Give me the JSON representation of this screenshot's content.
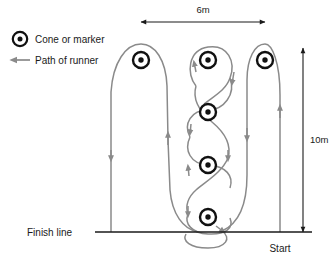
{
  "diagram": {
    "title_visible": false,
    "legend": {
      "items": [
        {
          "icon": "cone-marker-icon",
          "label": "Cone or marker"
        },
        {
          "icon": "path-arrow-icon",
          "label": "Path of runner"
        }
      ]
    },
    "dimensions": {
      "horizontal": {
        "label": "6m",
        "from_x": 141,
        "to_x": 265,
        "y": 22
      },
      "vertical": {
        "label": "10m",
        "from_y": 48,
        "to_y": 232,
        "x": 303
      }
    },
    "markers": {
      "labels": {
        "finish": "Finish line",
        "start": "Start"
      }
    },
    "cones": [
      {
        "name": "left-cone",
        "x": 141,
        "y": 60
      },
      {
        "name": "middle-cone-1",
        "x": 208,
        "y": 60
      },
      {
        "name": "middle-cone-2",
        "x": 208,
        "y": 112
      },
      {
        "name": "middle-cone-3",
        "x": 208,
        "y": 165
      },
      {
        "name": "middle-cone-4",
        "x": 208,
        "y": 217
      },
      {
        "name": "right-cone",
        "x": 265,
        "y": 60
      }
    ],
    "colors": {
      "path": "#8a8a8a",
      "cone": "#111111",
      "line": "#1a1a1a",
      "background": "#ffffff"
    },
    "finish_line": {
      "x1": 95,
      "x2": 312,
      "y": 232
    }
  }
}
